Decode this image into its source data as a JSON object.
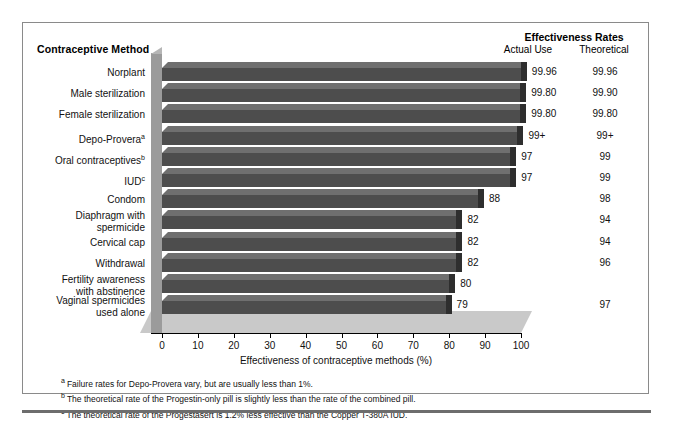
{
  "headers": {
    "method_column": "Contraceptive Method",
    "effectiveness_rates": "Effectiveness Rates",
    "actual_use": "Actual Use",
    "theoretical": "Theoretical"
  },
  "axis": {
    "title": "Effectiveness of contraceptive methods (%)",
    "ticks": [
      "0",
      "10",
      "20",
      "30",
      "40",
      "50",
      "60",
      "70",
      "80",
      "90",
      "100"
    ]
  },
  "rows": [
    {
      "label": "Norplant",
      "sup": "",
      "actual": "99.96",
      "theoretical": "99.96",
      "bar_pct": 99.96
    },
    {
      "label": "Male sterilization",
      "sup": "",
      "actual": "99.80",
      "theoretical": "99.90",
      "bar_pct": 99.8
    },
    {
      "label": "Female sterilization",
      "sup": "",
      "actual": "99.80",
      "theoretical": "99.80",
      "bar_pct": 99.8
    },
    {
      "label": "Depo-Provera",
      "sup": "a",
      "actual": "99+",
      "theoretical": "99+",
      "bar_pct": 99.0
    },
    {
      "label": "Oral contraceptives",
      "sup": "b",
      "actual": "97",
      "theoretical": "99",
      "bar_pct": 97
    },
    {
      "label": "IUD",
      "sup": "c",
      "actual": "97",
      "theoretical": "99",
      "bar_pct": 97
    },
    {
      "label": "Condom",
      "sup": "",
      "actual": "88",
      "theoretical": "98",
      "bar_pct": 88
    },
    {
      "label": "Diaphragm with\nspermicide",
      "sup": "",
      "actual": "82",
      "theoretical": "94",
      "bar_pct": 82
    },
    {
      "label": "Cervical cap",
      "sup": "",
      "actual": "82",
      "theoretical": "94",
      "bar_pct": 82
    },
    {
      "label": "Withdrawal",
      "sup": "",
      "actual": "82",
      "theoretical": "96",
      "bar_pct": 82
    },
    {
      "label": "Fertility awareness\nwith abstinence",
      "sup": "",
      "actual": "80",
      "theoretical": "",
      "bar_pct": 80
    },
    {
      "label": "Vaginal spermicides\nused alone",
      "sup": "",
      "actual": "79",
      "theoretical": "97",
      "bar_pct": 79
    }
  ],
  "footnotes": [
    {
      "marker": "a",
      "text": "Failure rates for Depo-Provera vary, but are usually less than 1%."
    },
    {
      "marker": "b",
      "text": "The theoretical rate of the Progestin-only pill is slightly less than the rate of the combined pill."
    },
    {
      "marker": "c",
      "text": "The theoretical rate of the Progestasert is 1.2% less effective than the Copper T-380A IUD."
    }
  ],
  "colors": {
    "bar_face": "#4d4d4d",
    "bar_top": "#6f6f6f",
    "bar_side": "#2e2e2e",
    "floor": "#c9c9c9",
    "wall": "#9b9b9b",
    "border": "#8a8a8a"
  },
  "chart_data": {
    "type": "bar",
    "title": "Effectiveness Rates",
    "xlabel": "Effectiveness of contraceptive methods (%)",
    "ylabel": "Contraceptive Method",
    "orientation": "horizontal",
    "xlim": [
      0,
      100
    ],
    "grid": false,
    "legend": "none",
    "xticks": [
      0,
      10,
      20,
      30,
      40,
      50,
      60,
      70,
      80,
      90,
      100
    ],
    "categories": [
      "Norplant",
      "Male sterilization",
      "Female sterilization",
      "Depo-Provera",
      "Oral contraceptives",
      "IUD",
      "Condom",
      "Diaphragm with spermicide",
      "Cervical cap",
      "Withdrawal",
      "Fertility awareness with abstinence",
      "Vaginal spermicides used alone"
    ],
    "series": [
      {
        "name": "Actual Use",
        "plotted": true,
        "values": [
          99.96,
          99.8,
          99.8,
          99,
          97,
          97,
          88,
          82,
          82,
          82,
          80,
          79
        ],
        "labels": [
          "99.96",
          "99.80",
          "99.80",
          "99+",
          "97",
          "97",
          "88",
          "82",
          "82",
          "82",
          "80",
          "79"
        ]
      },
      {
        "name": "Theoretical",
        "plotted": false,
        "values": [
          99.96,
          99.9,
          99.8,
          99,
          99,
          99,
          98,
          94,
          94,
          96,
          null,
          97
        ],
        "labels": [
          "99.96",
          "99.90",
          "99.80",
          "99+",
          "99",
          "99",
          "98",
          "94",
          "94",
          "96",
          "",
          "97"
        ]
      }
    ],
    "annotations": [
      "a Failure rates for Depo-Provera vary, but are usually less than 1%.",
      "b The theoretical rate of the Progestin-only pill is slightly less than the rate of the combined pill.",
      "c The theoretical rate of the Progestasert is 1.2% less effective than the Copper T-380A IUD."
    ]
  }
}
